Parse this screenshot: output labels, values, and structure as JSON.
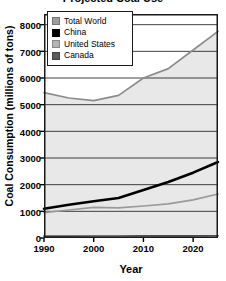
{
  "chart_data": {
    "type": "line",
    "title": "Projected Coal Use",
    "xlabel": "Year",
    "ylabel": "Coal Consumption (millions of tons)",
    "xlim": [
      1990,
      2025
    ],
    "ylim": [
      0,
      8400
    ],
    "xticks": [
      1990,
      2000,
      2010,
      2020
    ],
    "yticks": [
      0,
      1000,
      2000,
      3000,
      4000,
      5000,
      6000,
      7000,
      8000
    ],
    "grid": true,
    "legend_position": "top-left",
    "x": [
      1990,
      1995,
      2000,
      2005,
      2010,
      2015,
      2020,
      2025
    ],
    "series": [
      {
        "name": "Total World",
        "color": "#8c8c8c",
        "values": [
          5450,
          5250,
          5150,
          5350,
          6000,
          6350,
          7050,
          7750
        ],
        "filled": true
      },
      {
        "name": "China",
        "color": "#000000",
        "values": [
          1100,
          1250,
          1380,
          1500,
          1800,
          2100,
          2450,
          2850
        ],
        "filled": false
      },
      {
        "name": "United States",
        "color": "#9a9a9a",
        "values": [
          950,
          1050,
          1150,
          1130,
          1200,
          1280,
          1430,
          1650
        ],
        "filled": false
      },
      {
        "name": "Canada",
        "color": "#4d4d4d",
        "values": [
          70,
          72,
          75,
          75,
          78,
          80,
          82,
          85
        ],
        "filled": false
      }
    ]
  },
  "legend": {
    "items": [
      {
        "label": "Total World",
        "color": "#9e9e9e"
      },
      {
        "label": "China",
        "color": "#000000"
      },
      {
        "label": "United States",
        "color": "#b5b5b5"
      },
      {
        "label": "Canada",
        "color": "#5a5a5a"
      }
    ]
  },
  "axes": {
    "ytick_labels": [
      "8000",
      "7000",
      "6000",
      "5000",
      "4000",
      "3000",
      "2000",
      "1000",
      "0"
    ],
    "xtick_labels": [
      "1990",
      "2000",
      "2010",
      "2020"
    ]
  }
}
